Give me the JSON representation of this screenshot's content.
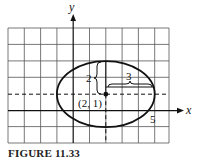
{
  "figure": {
    "caption": "FIGURE 11.33",
    "axes": {
      "x_label": "x",
      "y_label": "y"
    },
    "grid": {
      "x_min": -4,
      "x_max": 6,
      "y_min": -2,
      "y_max": 5,
      "step": 1
    },
    "ellipse": {
      "center": [
        2,
        1
      ],
      "center_label": "(2, 1)",
      "semi_major_horizontal": 3,
      "semi_minor_vertical": 2,
      "horizontal_brace_label": "3",
      "vertical_brace_label": "2"
    },
    "tick_labels": [
      {
        "value": 5,
        "axis": "x",
        "label": "5"
      }
    ],
    "colors": {
      "lines": "#111111",
      "grid": "#555555",
      "background": "#ffffff"
    }
  }
}
